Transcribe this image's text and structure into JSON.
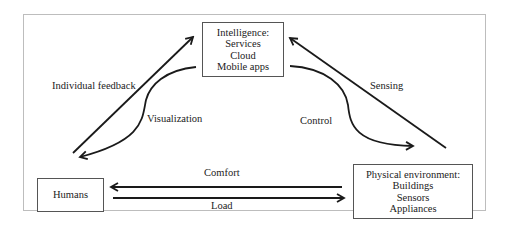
{
  "nodes": {
    "intelligence": {
      "title": "Intelligence:",
      "lines": [
        "Services",
        "Cloud",
        "Mobile apps"
      ]
    },
    "humans": {
      "title": "Humans"
    },
    "physical": {
      "title": "Physical environment:",
      "lines": [
        "Buildings",
        "Sensors",
        "Appliances"
      ]
    }
  },
  "edges": {
    "individual_feedback": "Individual feedback",
    "visualization": "Visualization",
    "sensing": "Sensing",
    "control": "Control",
    "comfort": "Comfort",
    "load": "Load"
  },
  "colors": {
    "arrow": "#1a1a1a",
    "frame": "#bdbdbd",
    "box_border": "#555555"
  }
}
